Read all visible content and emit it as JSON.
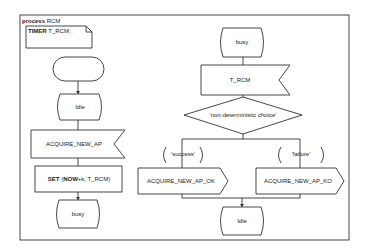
{
  "diagram": {
    "type": "SDL process diagram",
    "header": {
      "keyword": "process",
      "name": "RCM"
    },
    "declaration": {
      "keyword": "TIMER",
      "value": "T_RCM;"
    },
    "left_branch": {
      "start": "",
      "state1": "Idle",
      "input": "ACQUIRE_NEW_AP",
      "task": {
        "keyword": "SET",
        "open": "(",
        "now": "NOW",
        "rest": "+k, T_RCM)"
      },
      "state2": "busy"
    },
    "right_branch": {
      "state1": "busy",
      "input": "T_RCM",
      "decision": "'non-deterministic choice'",
      "answers": [
        "'success'",
        "'failure'"
      ],
      "outputs": [
        "ACQUIRE_NEW_AP_OK",
        "ACQUIRE_NEW_AP_KO"
      ],
      "next_state": "Idle"
    }
  }
}
